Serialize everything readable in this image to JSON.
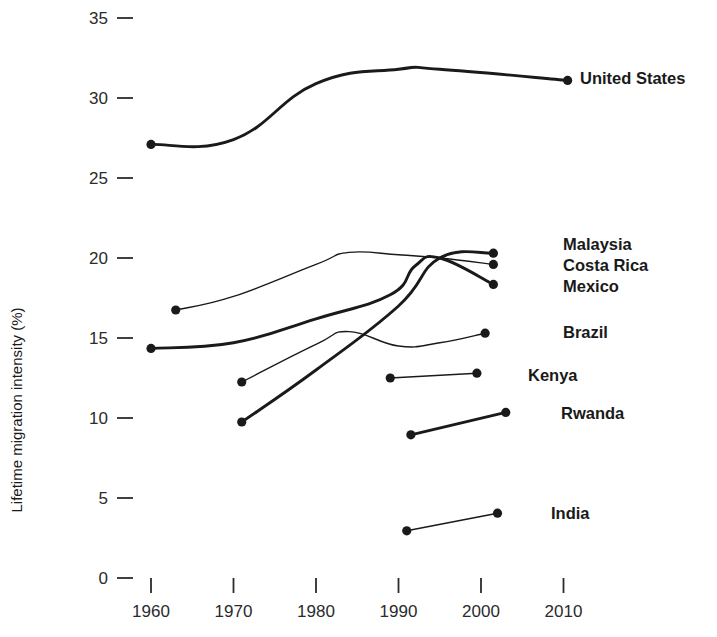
{
  "chart_data": {
    "type": "line",
    "title": "",
    "subtitle": "",
    "xlabel": "",
    "ylabel": "Lifetime migration intensity (%)",
    "xlim": [
      1956,
      2016
    ],
    "ylim": [
      0,
      35
    ],
    "grid": false,
    "legend_position": "right-of-line-ends",
    "x_ticks": [
      1960,
      1970,
      1980,
      1990,
      2000,
      2010
    ],
    "x_tick_labels": [
      "1960",
      "1970",
      "1980",
      "1990",
      "2000",
      "2010"
    ],
    "y_ticks": [
      0,
      5,
      10,
      15,
      20,
      25,
      30,
      35
    ],
    "y_tick_labels": [
      "0",
      "5",
      "10",
      "15",
      "20",
      "25",
      "30",
      "35"
    ],
    "series": [
      {
        "name": "United States",
        "label": "United States",
        "emphasis": "thick",
        "x": [
          1960,
          1970,
          1980,
          1990,
          1995,
          2010.5
        ],
        "y": [
          27.1,
          27.4,
          30.9,
          31.8,
          31.8,
          31.1
        ]
      },
      {
        "name": "Malaysia",
        "label": "Malaysia",
        "emphasis": "thick",
        "x": [
          1971,
          1980,
          1990,
          1995,
          2001.5
        ],
        "y": [
          9.75,
          13.0,
          17.0,
          20.0,
          20.3
        ]
      },
      {
        "name": "Costa Rica",
        "label": "Costa Rica",
        "emphasis": "thin",
        "x": [
          1963,
          1970,
          1980,
          1984,
          1990,
          1995,
          2001.5
        ],
        "y": [
          16.75,
          17.6,
          19.6,
          20.35,
          20.2,
          20.0,
          19.6
        ]
      },
      {
        "name": "Mexico",
        "label": "Mexico",
        "emphasis": "thick",
        "x": [
          1960,
          1970,
          1980,
          1989,
          1992,
          1995,
          2001.5
        ],
        "y": [
          14.35,
          14.7,
          16.2,
          17.7,
          19.5,
          20.0,
          18.35
        ]
      },
      {
        "name": "Brazil",
        "label": "Brazil",
        "emphasis": "thin",
        "x": [
          1971,
          1980,
          1984,
          1990,
          1995,
          2000.5
        ],
        "y": [
          12.25,
          14.6,
          15.4,
          14.5,
          14.7,
          15.3
        ]
      },
      {
        "name": "Kenya",
        "label": "Kenya",
        "emphasis": "thin",
        "x": [
          1989,
          1999.5
        ],
        "y": [
          12.5,
          12.8
        ]
      },
      {
        "name": "Rwanda",
        "label": "Rwanda",
        "emphasis": "thick",
        "x": [
          1991.5,
          2003
        ],
        "y": [
          8.95,
          10.35
        ]
      },
      {
        "name": "India",
        "label": "India",
        "emphasis": "thin",
        "x": [
          1991,
          2002
        ],
        "y": [
          2.95,
          4.05
        ]
      }
    ]
  },
  "colors": {
    "line": "#1a1a1a",
    "text": "#1a1a1a",
    "tick": "#2b2b2b",
    "background": "#ffffff"
  }
}
